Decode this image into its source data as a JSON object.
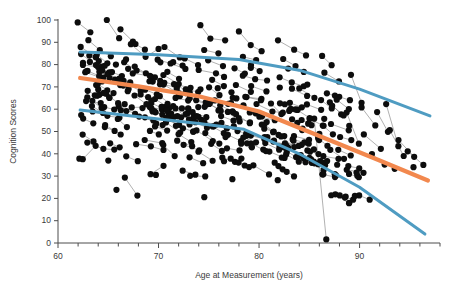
{
  "chart_data": {
    "type": "scatter",
    "title": "",
    "xlabel": "Age at Measurement (years)",
    "ylabel": "Cognition Scores",
    "xlim": [
      60,
      98
    ],
    "ylim": [
      0,
      100
    ],
    "xticks": [
      60,
      70,
      80,
      90
    ],
    "yticks": [
      0,
      10,
      20,
      30,
      40,
      50,
      60,
      70,
      80,
      90,
      100
    ],
    "xtick_labels": [
      "60",
      "70",
      "80",
      "90"
    ],
    "ytick_labels": [
      "0",
      "10",
      "20",
      "30",
      "40",
      "50",
      "60",
      "70",
      "80",
      "90",
      "100"
    ],
    "x_minor_step": 2,
    "grid": false,
    "legend": "none",
    "marker": {
      "shape": "circle",
      "color": "#0d0d0d",
      "size": 3.1
    },
    "connector_lines": {
      "color": "#6f6f6f",
      "width": 0.55,
      "note": "spaghetti lines linking repeated measures of the same subject"
    },
    "series": [
      {
        "name": "Upper trajectory",
        "type": "line",
        "color": "#4f9cc2",
        "width": 3.0,
        "points": [
          [
            62.2,
            85.6
          ],
          [
            70.0,
            84.4
          ],
          [
            78.0,
            82.3
          ],
          [
            84.0,
            77.5
          ],
          [
            90.0,
            69.0
          ],
          [
            97.0,
            57.0
          ]
        ]
      },
      {
        "name": "Median trajectory",
        "type": "line",
        "color": "#f2884e",
        "width": 4.2,
        "points": [
          [
            62.2,
            74.0
          ],
          [
            68.0,
            70.2
          ],
          [
            74.0,
            65.8
          ],
          [
            80.0,
            59.0
          ],
          [
            86.0,
            48.0
          ],
          [
            92.0,
            37.0
          ],
          [
            96.8,
            28.0
          ]
        ]
      },
      {
        "name": "Lower trajectory",
        "type": "line",
        "color": "#4f9cc2",
        "width": 3.0,
        "points": [
          [
            62.2,
            59.6
          ],
          [
            68.0,
            56.6
          ],
          [
            74.0,
            53.6
          ],
          [
            78.5,
            51.0
          ],
          [
            84.0,
            40.0
          ],
          [
            90.0,
            25.0
          ],
          [
            96.5,
            4.0
          ]
        ]
      }
    ],
    "subjects": [
      {
        "x": [
          62.1,
          63.4
        ],
        "y": [
          100.0,
          95.0
        ]
      },
      {
        "x": [
          63.0,
          64.2,
          65.4
        ],
        "y": [
          92.0,
          86.0,
          84.0
        ]
      },
      {
        "x": [
          64.6,
          65.9
        ],
        "y": [
          100.0,
          92.0
        ]
      },
      {
        "x": [
          66.0,
          67.2
        ],
        "y": [
          95.0,
          90.0
        ]
      },
      {
        "x": [
          67.4,
          68.6,
          69.9
        ],
        "y": [
          88.0,
          84.0,
          86.0
        ]
      },
      {
        "x": [
          62.4,
          63.6
        ],
        "y": [
          84.0,
          79.0
        ]
      },
      {
        "x": [
          62.6,
          63.9,
          65.1
        ],
        "y": [
          80.0,
          78.0,
          76.0
        ]
      },
      {
        "x": [
          63.2,
          64.5
        ],
        "y": [
          76.0,
          74.0
        ]
      },
      {
        "x": [
          63.8,
          65.0,
          66.3
        ],
        "y": [
          72.0,
          73.0,
          71.0
        ]
      },
      {
        "x": [
          64.0,
          65.3
        ],
        "y": [
          68.0,
          66.0
        ]
      },
      {
        "x": [
          62.8,
          64.1
        ],
        "y": [
          64.0,
          62.0
        ]
      },
      {
        "x": [
          63.5,
          64.8,
          66.0
        ],
        "y": [
          60.0,
          58.0,
          57.0
        ]
      },
      {
        "x": [
          62.3,
          63.6
        ],
        "y": [
          55.0,
          54.0
        ]
      },
      {
        "x": [
          64.4,
          65.7
        ],
        "y": [
          52.0,
          50.0
        ]
      },
      {
        "x": [
          62.2,
          63.5
        ],
        "y": [
          48.0,
          46.0
        ]
      },
      {
        "x": [
          63.1,
          64.4,
          65.6
        ],
        "y": [
          44.0,
          43.0,
          43.0
        ]
      },
      {
        "x": [
          62.5,
          63.8
        ],
        "y": [
          37.0,
          44.0
        ]
      },
      {
        "x": [
          65.0,
          66.3
        ],
        "y": [
          44.0,
          43.0
        ]
      },
      {
        "x": [
          66.6,
          67.9
        ],
        "y": [
          38.0,
          37.0
        ]
      },
      {
        "x": [
          66.8,
          68.1
        ],
        "y": [
          29.0,
          20.5
        ]
      },
      {
        "x": [
          68.0,
          69.3,
          70.5
        ],
        "y": [
          44.0,
          43.0,
          42.0
        ]
      },
      {
        "x": [
          66.5,
          67.8,
          69.0
        ],
        "y": [
          80.0,
          78.0,
          76.0
        ]
      },
      {
        "x": [
          67.0,
          68.3
        ],
        "y": [
          72.0,
          70.0
        ]
      },
      {
        "x": [
          68.5,
          69.8
        ],
        "y": [
          68.0,
          66.0
        ]
      },
      {
        "x": [
          67.6,
          68.9,
          70.1
        ],
        "y": [
          62.0,
          60.0,
          59.0
        ]
      },
      {
        "x": [
          68.2,
          69.5
        ],
        "y": [
          56.0,
          54.0
        ]
      },
      {
        "x": [
          69.0,
          70.3
        ],
        "y": [
          50.0,
          49.0
        ]
      },
      {
        "x": [
          68.8,
          70.1
        ],
        "y": [
          46.0,
          45.0
        ]
      },
      {
        "x": [
          70.0,
          71.3,
          72.5
        ],
        "y": [
          82.0,
          80.0,
          78.0
        ]
      },
      {
        "x": [
          70.6,
          71.9
        ],
        "y": [
          88.0,
          84.0
        ]
      },
      {
        "x": [
          71.0,
          72.3
        ],
        "y": [
          76.0,
          74.0
        ]
      },
      {
        "x": [
          70.4,
          71.7,
          72.9
        ],
        "y": [
          72.0,
          70.0,
          68.0
        ]
      },
      {
        "x": [
          71.5,
          72.8
        ],
        "y": [
          66.0,
          64.0
        ]
      },
      {
        "x": [
          70.8,
          72.1
        ],
        "y": [
          62.0,
          60.0
        ]
      },
      {
        "x": [
          71.2,
          72.5,
          73.7
        ],
        "y": [
          58.0,
          56.0,
          55.0
        ]
      },
      {
        "x": [
          72.0,
          73.3
        ],
        "y": [
          52.0,
          50.0
        ]
      },
      {
        "x": [
          71.8,
          73.1
        ],
        "y": [
          48.0,
          46.0
        ]
      },
      {
        "x": [
          72.6,
          73.9
        ],
        "y": [
          43.0,
          41.0
        ]
      },
      {
        "x": [
          73.0,
          74.3
        ],
        "y": [
          38.0,
          36.0
        ]
      },
      {
        "x": [
          72.2,
          73.5
        ],
        "y": [
          32.0,
          31.0
        ]
      },
      {
        "x": [
          73.4,
          74.7
        ],
        "y": [
          29.0,
          29.0
        ]
      },
      {
        "x": [
          69.4,
          70.7
        ],
        "y": [
          31.0,
          34.0
        ]
      },
      {
        "x": [
          74.0,
          75.3,
          76.5
        ],
        "y": [
          98.0,
          92.0,
          90.0
        ]
      },
      {
        "x": [
          74.6,
          75.9
        ],
        "y": [
          86.0,
          84.0
        ]
      },
      {
        "x": [
          75.0,
          76.3
        ],
        "y": [
          82.0,
          80.0
        ]
      },
      {
        "x": [
          74.2,
          75.5,
          76.7
        ],
        "y": [
          78.0,
          76.0,
          75.0
        ]
      },
      {
        "x": [
          75.4,
          76.7
        ],
        "y": [
          73.0,
          71.0
        ]
      },
      {
        "x": [
          74.8,
          76.1
        ],
        "y": [
          69.0,
          67.0
        ]
      },
      {
        "x": [
          75.8,
          77.1,
          78.3
        ],
        "y": [
          65.0,
          63.0,
          62.0
        ]
      },
      {
        "x": [
          76.0,
          77.3
        ],
        "y": [
          60.0,
          58.0
        ]
      },
      {
        "x": [
          76.4,
          77.7
        ],
        "y": [
          56.0,
          54.0
        ]
      },
      {
        "x": [
          75.2,
          76.5
        ],
        "y": [
          52.0,
          50.0
        ]
      },
      {
        "x": [
          76.8,
          78.1
        ],
        "y": [
          48.0,
          46.0
        ]
      },
      {
        "x": [
          77.0,
          78.3
        ],
        "y": [
          43.0,
          41.0
        ]
      },
      {
        "x": [
          76.2,
          77.5
        ],
        "y": [
          38.0,
          37.0
        ]
      },
      {
        "x": [
          77.8,
          79.1
        ],
        "y": [
          35.0,
          34.0
        ]
      },
      {
        "x": [
          78.0,
          79.3,
          80.5
        ],
        "y": [
          96.0,
          88.0,
          86.0
        ]
      },
      {
        "x": [
          78.6,
          79.9
        ],
        "y": [
          84.0,
          82.0
        ]
      },
      {
        "x": [
          79.0,
          80.3
        ],
        "y": [
          80.0,
          78.0
        ]
      },
      {
        "x": [
          78.2,
          79.5,
          80.7
        ],
        "y": [
          76.0,
          74.0,
          72.0
        ]
      },
      {
        "x": [
          79.4,
          80.7
        ],
        "y": [
          70.0,
          68.0
        ]
      },
      {
        "x": [
          78.8,
          80.1
        ],
        "y": [
          66.0,
          64.0
        ]
      },
      {
        "x": [
          79.8,
          81.1,
          82.3
        ],
        "y": [
          62.0,
          60.0,
          58.0
        ]
      },
      {
        "x": [
          80.0,
          81.3
        ],
        "y": [
          56.0,
          54.0
        ]
      },
      {
        "x": [
          80.4,
          81.7
        ],
        "y": [
          52.0,
          50.0
        ]
      },
      {
        "x": [
          79.2,
          80.5
        ],
        "y": [
          48.0,
          47.0
        ]
      },
      {
        "x": [
          80.8,
          82.1
        ],
        "y": [
          44.0,
          43.0
        ]
      },
      {
        "x": [
          81.0,
          82.3
        ],
        "y": [
          40.0,
          38.0
        ]
      },
      {
        "x": [
          81.6,
          82.9
        ],
        "y": [
          35.0,
          33.0
        ]
      },
      {
        "x": [
          82.0,
          83.3,
          84.5
        ],
        "y": [
          90.0,
          86.0,
          84.0
        ]
      },
      {
        "x": [
          82.6,
          83.9
        ],
        "y": [
          82.0,
          80.0
        ]
      },
      {
        "x": [
          83.0,
          84.3
        ],
        "y": [
          78.0,
          76.0
        ]
      },
      {
        "x": [
          82.2,
          83.5,
          84.7
        ],
        "y": [
          74.0,
          72.0,
          70.0
        ]
      },
      {
        "x": [
          83.4,
          84.7
        ],
        "y": [
          68.0,
          66.0
        ]
      },
      {
        "x": [
          82.8,
          84.1
        ],
        "y": [
          64.0,
          61.0
        ]
      },
      {
        "x": [
          83.8,
          85.1
        ],
        "y": [
          59.0,
          57.0
        ]
      },
      {
        "x": [
          84.0,
          85.3
        ],
        "y": [
          55.0,
          53.0
        ]
      },
      {
        "x": [
          84.4,
          85.7
        ],
        "y": [
          50.0,
          48.0
        ]
      },
      {
        "x": [
          83.2,
          84.5
        ],
        "y": [
          46.0,
          44.0
        ]
      },
      {
        "x": [
          84.8,
          86.1
        ],
        "y": [
          42.0,
          40.0
        ]
      },
      {
        "x": [
          85.0,
          86.3
        ],
        "y": [
          38.0,
          36.0
        ]
      },
      {
        "x": [
          85.4,
          86.7
        ],
        "y": [
          55.0,
          0.5
        ]
      },
      {
        "x": [
          86.0,
          87.3
        ],
        "y": [
          84.0,
          80.0
        ]
      },
      {
        "x": [
          86.4,
          87.7
        ],
        "y": [
          76.0,
          72.0
        ]
      },
      {
        "x": [
          86.8,
          88.1
        ],
        "y": [
          68.0,
          65.0
        ]
      },
      {
        "x": [
          87.0,
          88.3
        ],
        "y": [
          62.0,
          58.0
        ]
      },
      {
        "x": [
          87.4,
          88.7
        ],
        "y": [
          54.0,
          51.0
        ]
      },
      {
        "x": [
          87.8,
          89.1
        ],
        "y": [
          48.0,
          45.0
        ]
      },
      {
        "x": [
          88.0,
          89.3
        ],
        "y": [
          42.0,
          39.0
        ]
      },
      {
        "x": [
          88.6,
          89.9
        ],
        "y": [
          58.0,
          44.0
        ]
      },
      {
        "x": [
          89.0,
          90.3
        ],
        "y": [
          76.0,
          64.0
        ]
      },
      {
        "x": [
          90.0,
          91.3
        ],
        "y": [
          60.0,
          52.0
        ]
      },
      {
        "x": [
          90.6,
          91.9
        ],
        "y": [
          48.0,
          43.0
        ]
      },
      {
        "x": [
          91.0,
          92.3
        ],
        "y": [
          40.0,
          36.0
        ]
      },
      {
        "x": [
          91.6,
          92.9
        ],
        "y": [
          58.0,
          50.0
        ]
      },
      {
        "x": [
          92.4,
          93.7
        ],
        "y": [
          62.0,
          44.0
        ]
      },
      {
        "x": [
          93.0,
          94.3
        ],
        "y": [
          50.0,
          40.0
        ]
      },
      {
        "x": [
          94.0,
          95.3
        ],
        "y": [
          46.0,
          38.0
        ]
      },
      {
        "x": [
          95.0,
          96.3
        ],
        "y": [
          42.0,
          36.0
        ]
      },
      {
        "x": [
          66.0
        ],
        "y": [
          25.0
        ]
      },
      {
        "x": [
          74.5
        ],
        "y": [
          20.0
        ]
      },
      {
        "x": [
          88.5
        ],
        "y": [
          20.5
        ]
      },
      {
        "x": [
          69.8
        ],
        "y": [
          30.0
        ]
      },
      {
        "x": [
          64.8
        ],
        "y": [
          36.0
        ]
      },
      {
        "x": [
          77.2
        ],
        "y": [
          28.5
        ]
      },
      {
        "x": [
          62.0
        ],
        "y": [
          37.0
        ]
      },
      {
        "x": [
          93.5
        ],
        "y": [
          34.0
        ]
      },
      {
        "x": [
          95.5
        ],
        "y": [
          33.0
        ]
      }
    ]
  },
  "axes": {
    "x_title": "Age at Measurement (years)",
    "y_title": "Cognition Scores"
  }
}
